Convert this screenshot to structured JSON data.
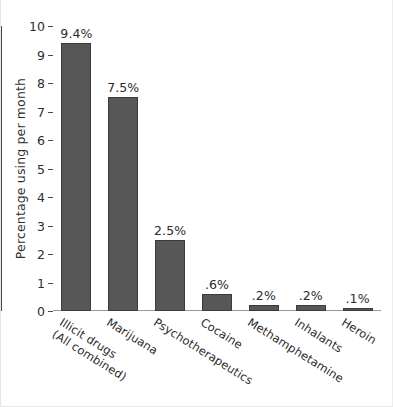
{
  "chart_data": {
    "type": "bar",
    "title": "",
    "subtitle": "",
    "xlabel": "",
    "ylabel": "Percentage using per month",
    "ylim": [
      0,
      10
    ],
    "ytick_labels": [
      "0",
      "1",
      "2",
      "3",
      "4",
      "5",
      "6",
      "7",
      "8",
      "9",
      "10"
    ],
    "yticks": [
      0,
      1,
      2,
      3,
      4,
      5,
      6,
      7,
      8,
      9,
      10
    ],
    "grid": false,
    "legend": null,
    "categories": [
      "Illicit drugs\n(All combined)",
      "Marijuana",
      "Psychotherapeutics",
      "Cocaine",
      "Methamphetamine",
      "Inhalants",
      "Heroin"
    ],
    "category_lines": [
      [
        "Illicit drugs",
        "(All combined)"
      ],
      [
        "Marijuana"
      ],
      [
        "Psychotherapeutics"
      ],
      [
        "Cocaine"
      ],
      [
        "Methamphetamine"
      ],
      [
        "Inhalants"
      ],
      [
        "Heroin"
      ]
    ],
    "values": [
      9.4,
      7.5,
      2.5,
      0.6,
      0.2,
      0.2,
      0.1
    ],
    "value_labels": [
      "9.4%",
      "7.5%",
      "2.5%",
      ".6%",
      ".2%",
      ".2%",
      ".1%"
    ],
    "bar_color": "#575757",
    "bar_edge_color": "#3b3b3b",
    "axis_color": "#4a4a4a",
    "text_color": "#2b2b2b",
    "background": "#ffffff"
  }
}
